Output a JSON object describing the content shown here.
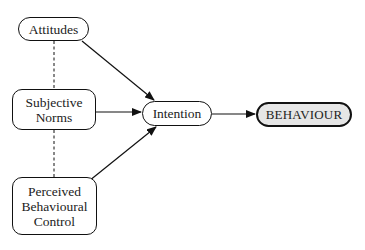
{
  "diagram": {
    "nodes": {
      "attitudes": {
        "label": "Attitudes"
      },
      "subjective_norms": {
        "label": "Subjective\nNorms"
      },
      "pbc": {
        "label": "Perceived\nBehavioural\nControl"
      },
      "intention": {
        "label": "Intention"
      },
      "behaviour": {
        "label": "BEHAVIOUR"
      }
    },
    "edges": [
      {
        "from": "Attitudes",
        "to": "Intention",
        "style": "arrow"
      },
      {
        "from": "Subjective Norms",
        "to": "Intention",
        "style": "arrow"
      },
      {
        "from": "Perceived Behavioural Control",
        "to": "Intention",
        "style": "arrow"
      },
      {
        "from": "Intention",
        "to": "BEHAVIOUR",
        "style": "arrow"
      },
      {
        "from": "Attitudes",
        "to": "Subjective Norms",
        "style": "dashed"
      },
      {
        "from": "Subjective Norms",
        "to": "Perceived Behavioural Control",
        "style": "dashed"
      }
    ],
    "colors": {
      "stroke": "#111111",
      "behaviour_fill": "#e6e6e6",
      "node_fill": "#ffffff"
    }
  }
}
